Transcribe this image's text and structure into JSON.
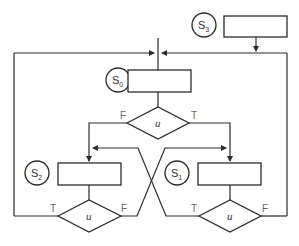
{
  "diagram": {
    "states": [
      {
        "id": "S0",
        "label": "S",
        "sub": "0"
      },
      {
        "id": "S1",
        "label": "S",
        "sub": "1"
      },
      {
        "id": "S2",
        "label": "S",
        "sub": "2"
      },
      {
        "id": "S3",
        "label": "S",
        "sub": "3"
      }
    ],
    "decisions": [
      {
        "id": "top",
        "label": "u",
        "true_label": "T",
        "false_label": "F"
      },
      {
        "id": "bottom_left",
        "label": "u",
        "true_label": "T",
        "false_label": "F"
      },
      {
        "id": "bottom_right",
        "label": "u",
        "true_label": "T",
        "false_label": "F"
      }
    ]
  }
}
